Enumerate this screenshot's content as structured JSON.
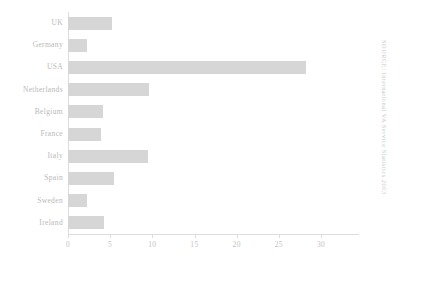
{
  "chart_data": {
    "type": "bar",
    "orientation": "horizontal",
    "title": "",
    "xlabel": "",
    "ylabel": "",
    "categories": [
      "UK",
      "Germany",
      "USA",
      "Netherlands",
      "Belgium",
      "France",
      "Italy",
      "Spain",
      "Sweden",
      "Ireland"
    ],
    "values": [
      5.2,
      2.3,
      28.2,
      9.6,
      4.2,
      3.9,
      9.5,
      5.4,
      2.2,
      4.3
    ],
    "xlim": [
      0,
      34.5
    ],
    "xticks": [
      0,
      5,
      10,
      15,
      20,
      25,
      30
    ],
    "xtick_labels": [
      "0",
      "5",
      "10",
      "15",
      "20",
      "25",
      "30"
    ],
    "grid": false,
    "legend": null,
    "bar_color": "#d6d6d6",
    "axis_color": "#dcdcdc",
    "label_color": "#b9b9b9",
    "tick_label_color": "#c3c3c3"
  },
  "annotations": {
    "source_caption": "SOURCE: International VA Service Statistics 2003",
    "source_color": "#c9c9c9"
  }
}
